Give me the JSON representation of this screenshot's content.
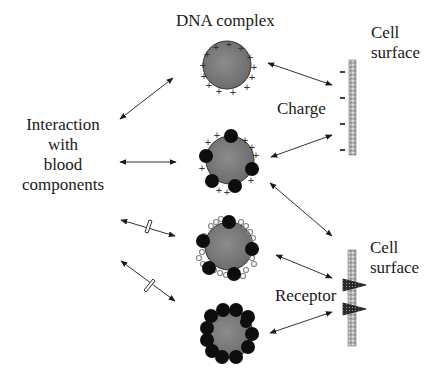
{
  "diagram": {
    "title": "DNA complex",
    "left_label": [
      "Interaction",
      "with",
      "blood",
      "components"
    ],
    "charge_label": "Charge",
    "receptor_label": "Receptor",
    "cell_surface_top": [
      "Cell",
      "surface"
    ],
    "cell_surface_bottom": [
      "Cell",
      "surface"
    ],
    "complexes": [
      {
        "id": "cationic",
        "description": "DNA complex with positive surface charges",
        "charges": "+",
        "ligands": 0,
        "peg": false
      },
      {
        "id": "cationic-ligand",
        "description": "DNA complex with positive charges and attached ligands",
        "charges": "+",
        "ligands": 6,
        "peg": false
      },
      {
        "id": "shielded-ligand",
        "description": "DNA complex with ligands and shielding polymer",
        "charges": "",
        "ligands": 6,
        "peg": true
      },
      {
        "id": "ligand-coated",
        "description": "DNA complex densely coated with ligands",
        "charges": "",
        "ligands": 14,
        "peg": false
      }
    ],
    "blood_interactions": [
      {
        "complex": "cationic",
        "blocked": false
      },
      {
        "complex": "cationic-ligand",
        "blocked": false
      },
      {
        "complex": "shielded-ligand",
        "blocked": true
      },
      {
        "complex": "ligand-coated",
        "blocked": true
      }
    ],
    "cell_interactions": [
      {
        "complex": "cationic",
        "target": "charge"
      },
      {
        "complex": "cationic-ligand",
        "target": "charge"
      },
      {
        "complex": "cationic-ligand",
        "target": "receptor"
      },
      {
        "complex": "shielded-ligand",
        "target": "receptor"
      },
      {
        "complex": "ligand-coated",
        "target": "receptor"
      }
    ],
    "membrane_charge_symbol": "−",
    "colors": {
      "core": "#7a7a7a",
      "ligand": "#0d0d0d",
      "membrane": "#a8a8a8",
      "arrow": "#333333",
      "text": "#1a1a1a"
    }
  }
}
